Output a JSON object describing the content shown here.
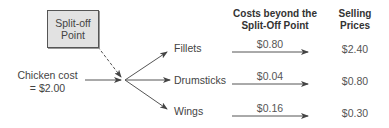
{
  "split_off_box": {
    "line1": "Split-off",
    "line2": "Point",
    "fill": "#e2e2e2"
  },
  "source": {
    "line1": "Chicken cost",
    "line2": "= $2.00"
  },
  "headers": {
    "costs": {
      "line1": "Costs beyond the",
      "line2": "Split-Off Point"
    },
    "prices": {
      "line1": "Selling",
      "line2": "Prices"
    }
  },
  "products": [
    {
      "name": "Fillets",
      "further_cost": "$0.80",
      "selling_price": "$2.40"
    },
    {
      "name": "Drumsticks",
      "further_cost": "$0.04",
      "selling_price": "$0.80"
    },
    {
      "name": "Wings",
      "further_cost": "$0.16",
      "selling_price": "$0.30"
    }
  ],
  "colors": {
    "line": "#555555",
    "text": "#444444"
  }
}
